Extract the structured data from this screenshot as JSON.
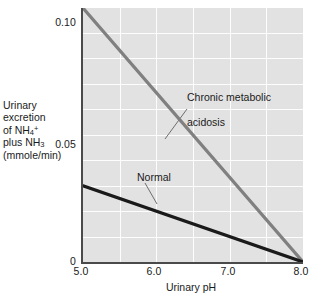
{
  "chart_data": {
    "type": "line",
    "title": "",
    "xlabel": "Urinary pH",
    "ylabel_lines": [
      "Urinary",
      "excretion",
      "of NH",
      "plus NH",
      "(mmole/min)"
    ],
    "ylabel_text": "Urinary excretion of NH4+ plus NH3 (mmole/min)",
    "xlim": [
      5.0,
      8.0
    ],
    "ylim": [
      0,
      0.105
    ],
    "xticks": [
      "5.0",
      "6.0",
      "7.0",
      "8.0"
    ],
    "xtick_values": [
      5.0,
      6.0,
      7.0,
      8.0
    ],
    "yticks": [
      "0",
      "0.05",
      "0.10"
    ],
    "ytick_values": [
      0,
      0.05,
      0.1
    ],
    "grid": "both-minor-white",
    "grid_x_minor_count": 6,
    "grid_y_minor_count": 10,
    "legend": "inline-annotations",
    "series": [
      {
        "name": "Chronic metabolic acidosis",
        "label_text": "Chronic metabolic\nacidosis",
        "color": "#808080",
        "width": 3.2,
        "x": [
          5.0,
          8.0
        ],
        "values": [
          0.105,
          0.0
        ]
      },
      {
        "name": "Normal",
        "label_text": "Normal",
        "color": "#1a1a1a",
        "width": 3.2,
        "x": [
          5.0,
          8.0
        ],
        "values": [
          0.0315,
          0.0
        ]
      }
    ],
    "annotations": [
      {
        "text": "Chronic metabolic\nacidosis",
        "anchor_x": 6.45,
        "anchor_y": 0.0495
      },
      {
        "text": "Normal",
        "anchor_x": 5.95,
        "anchor_y": 0.0205
      }
    ]
  },
  "ylabel": {
    "line1": "Urinary",
    "line2": "excretion",
    "line3_pre": "of NH",
    "line3_sub": "4",
    "line3_sup": "+",
    "line4_pre": "plus NH",
    "line4_sub": "3",
    "line5": "(mmole/min)"
  },
  "axis": {
    "x_title": "Urinary pH",
    "ytick_0": "0",
    "ytick_005": "0.05",
    "ytick_010": "0.10",
    "xtick_50": "5.0",
    "xtick_60": "6.0",
    "xtick_70": "7.0",
    "xtick_80": "8.0"
  },
  "annotations": {
    "acidosis_line1": "Chronic metabolic",
    "acidosis_line2": "acidosis",
    "normal": "Normal"
  },
  "colors": {
    "plot_background": "#e2e2e2",
    "gridline": "#fdfdfd",
    "axis": "#4a4a4a",
    "acidosis_line": "#808080",
    "normal_line": "#1a1a1a",
    "text": "#1a1a1a"
  }
}
